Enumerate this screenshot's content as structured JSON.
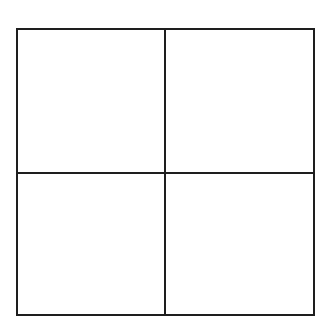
{
  "diagram": {
    "type": "grid",
    "rows": 2,
    "columns": 2,
    "line_color": "#1e1e1e",
    "background_color": "#ffffff",
    "cells": [
      {
        "row": 0,
        "col": 0,
        "label": ""
      },
      {
        "row": 0,
        "col": 1,
        "label": ""
      },
      {
        "row": 1,
        "col": 0,
        "label": ""
      },
      {
        "row": 1,
        "col": 1,
        "label": ""
      }
    ]
  }
}
